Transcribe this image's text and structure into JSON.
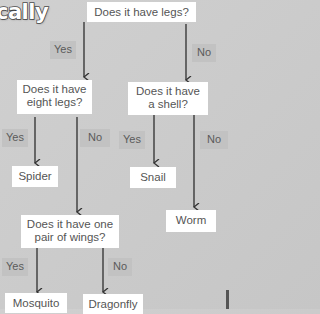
{
  "title": "cally",
  "nodes": {
    "q_legs": "Does it have legs?",
    "q_eight_legs_1": "Does it have",
    "q_eight_legs_2": "eight legs?",
    "q_shell_1": "Does it have",
    "q_shell_2": "a shell?",
    "spider": "Spider",
    "snail": "Snail",
    "worm": "Worm",
    "q_wings_1": "Does it have one",
    "q_wings_2": "pair of wings?",
    "mosquito": "Mosquito",
    "dragonfly": "Dragonfly"
  },
  "edges": {
    "legs_yes": "Yes",
    "legs_no": "No",
    "eight_yes": "Yes",
    "eight_no": "No",
    "shell_yes": "Yes",
    "shell_no": "No",
    "wings_yes": "Yes",
    "wings_no": "No"
  },
  "colors": {
    "background": "#cbcbcb",
    "box": "#ffffff",
    "label_bg": "#c2c2c2",
    "arrow": "#333333",
    "text": "#555555"
  }
}
